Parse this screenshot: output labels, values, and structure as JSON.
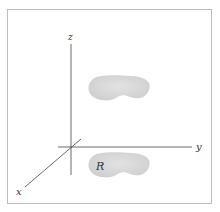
{
  "diagram": {
    "axes": {
      "x": {
        "label": "x"
      },
      "y": {
        "label": "y"
      },
      "z": {
        "label": "z"
      }
    },
    "regions": [
      {
        "name": "projected-region-upper",
        "label": ""
      },
      {
        "name": "base-region",
        "label": "R"
      }
    ],
    "colors": {
      "axis": "#444444",
      "region_fill": "#d9d9d9",
      "frame": "#bdbdbd"
    }
  }
}
